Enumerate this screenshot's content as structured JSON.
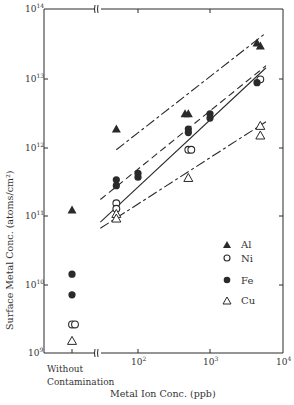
{
  "chart_data": {
    "type": "scatter",
    "title": "",
    "xlabel": "Metal Ion Conc. (ppb)",
    "ylabel": "Surface Metal Conc. (atoms/cm²)",
    "xscale": "log",
    "yscale": "log",
    "xlim": [
      10,
      10000
    ],
    "ylim": [
      1000000000.0,
      100000000000000.0
    ],
    "grid": false,
    "legend_position": "lower right inside",
    "x_ticks": [
      {
        "label": "Without\nContamination",
        "value": "without"
      },
      {
        "label": "10^2",
        "value": 100
      },
      {
        "label": "10^3",
        "value": 1000
      },
      {
        "label": "10^4",
        "value": 10000
      }
    ],
    "y_ticks": [
      "10^9",
      "10^10",
      "10^11",
      "10^12",
      "10^13",
      "10^14"
    ],
    "x_axis_break": true,
    "x_tick_labels": {
      "without_line1": "Without",
      "without_line2": "Contamination",
      "e2": "10",
      "e2_sup": "2",
      "e3": "10",
      "e3_sup": "3",
      "e4": "10",
      "e4_sup": "4"
    },
    "series": [
      {
        "name": "Al",
        "marker": "filled-triangle",
        "line_style": "dash-dot",
        "points": [
          {
            "x": "without",
            "y": 120000000000.0
          },
          {
            "x": 50,
            "y": 1800000000000.0
          },
          {
            "x": 450,
            "y": 3000000000000.0
          },
          {
            "x": 500,
            "y": 3000000000000.0
          },
          {
            "x": 4500,
            "y": 32000000000000.0
          },
          {
            "x": 5000,
            "y": 29000000000000.0
          }
        ],
        "fit_line": {
          "x": [
            50,
            6000
          ],
          "y": [
            900000000000.0,
            45000000000000.0
          ]
        }
      },
      {
        "name": "Ni",
        "marker": "open-circle",
        "line_style": "solid",
        "points": [
          {
            "x": "without",
            "y": 2600000000.0
          },
          {
            "x": "without",
            "y": 2600000000.0
          },
          {
            "x": 50,
            "y": 150000000000.0
          },
          {
            "x": 50,
            "y": 125000000000.0
          },
          {
            "x": 500,
            "y": 900000000000.0
          },
          {
            "x": 550,
            "y": 900000000000.0
          },
          {
            "x": 5000,
            "y": 9500000000000.0
          }
        ],
        "fit_line": {
          "x": [
            30,
            6000
          ],
          "y": [
            80000000000.0,
            14000000000000.0
          ]
        }
      },
      {
        "name": "Fe",
        "marker": "filled-circle",
        "line_style": "dashed",
        "points": [
          {
            "x": "without",
            "y": 14000000000.0
          },
          {
            "x": "without",
            "y": 7000000000.0
          },
          {
            "x": 50,
            "y": 330000000000.0
          },
          {
            "x": 50,
            "y": 270000000000.0
          },
          {
            "x": 100,
            "y": 410000000000.0
          },
          {
            "x": 100,
            "y": 360000000000.0
          },
          {
            "x": 500,
            "y": 1800000000000.0
          },
          {
            "x": 500,
            "y": 1600000000000.0
          },
          {
            "x": 1000,
            "y": 3000000000000.0
          },
          {
            "x": 1000,
            "y": 2600000000000.0
          },
          {
            "x": 4500,
            "y": 8500000000000.0
          }
        ],
        "fit_line": {
          "x": [
            30,
            6000
          ],
          "y": [
            170000000000.0,
            15000000000000.0
          ]
        }
      },
      {
        "name": "Cu",
        "marker": "open-triangle",
        "line_style": "dash-dot",
        "points": [
          {
            "x": "without",
            "y": 1500000000.0
          },
          {
            "x": 50,
            "y": 105000000000.0
          },
          {
            "x": 50,
            "y": 90000000000.0
          },
          {
            "x": 500,
            "y": 350000000000.0
          },
          {
            "x": 5000,
            "y": 2000000000000.0
          },
          {
            "x": 5000,
            "y": 1450000000000.0
          }
        ],
        "fit_line": {
          "x": [
            30,
            6000
          ],
          "y": [
            65000000000.0,
            2300000000000.0
          ]
        }
      }
    ]
  },
  "legend": {
    "items": [
      {
        "label": "Al",
        "marker": "filled-triangle"
      },
      {
        "label": "Ni",
        "marker": "open-circle"
      },
      {
        "label": "Fe",
        "marker": "filled-circle"
      },
      {
        "label": "Cu",
        "marker": "open-triangle"
      }
    ]
  },
  "axes": {
    "xlabel": "Metal Ion Conc. (ppb)",
    "ylabel": "Surface Metal Conc. (atoms/cm²)",
    "y_tick_base": "10",
    "y_tick_exponents": [
      "9",
      "10",
      "11",
      "12",
      "13",
      "14"
    ]
  },
  "colors": {
    "ink": "#2a2a2a",
    "background": "#ffffff"
  }
}
